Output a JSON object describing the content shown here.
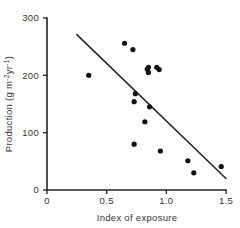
{
  "chart_data": {
    "type": "scatter",
    "title": "",
    "xlabel": "Index of  exposure",
    "ylabel": "Production (g m⁻²yr⁻¹)",
    "ylabel_parts": {
      "main": "Production (g m",
      "sup1": "-2",
      "mid": "yr",
      "sup2": "-1",
      "tail": ")"
    },
    "xlim": [
      0,
      1.5
    ],
    "ylim": [
      0,
      300
    ],
    "xticks": [
      0,
      0.5,
      1.0,
      1.5
    ],
    "xtick_labels": [
      "0",
      "0.5",
      "1.0",
      "1.5"
    ],
    "yticks": [
      0,
      100,
      200,
      300
    ],
    "ytick_labels": [
      "0",
      "100",
      "200",
      "300"
    ],
    "grid": false,
    "legend": false,
    "legend_position": "none",
    "marker": "filled-circle",
    "marker_color": "#111111",
    "axis_color": "#222222",
    "background_color": "#ffffff",
    "points": [
      {
        "x": 0.35,
        "y": 200
      },
      {
        "x": 0.65,
        "y": 256
      },
      {
        "x": 0.72,
        "y": 245
      },
      {
        "x": 0.74,
        "y": 168
      },
      {
        "x": 0.73,
        "y": 154
      },
      {
        "x": 0.73,
        "y": 80
      },
      {
        "x": 0.82,
        "y": 119
      },
      {
        "x": 0.84,
        "y": 211
      },
      {
        "x": 0.85,
        "y": 205
      },
      {
        "x": 0.85,
        "y": 214
      },
      {
        "x": 0.86,
        "y": 145
      },
      {
        "x": 0.92,
        "y": 214
      },
      {
        "x": 0.94,
        "y": 210
      },
      {
        "x": 0.95,
        "y": 68
      },
      {
        "x": 1.18,
        "y": 51
      },
      {
        "x": 1.23,
        "y": 30
      },
      {
        "x": 1.46,
        "y": 41
      }
    ],
    "trend_line": {
      "type": "straight-fit-line",
      "x_start": 0.25,
      "y_start": 271,
      "x_end": 1.5,
      "y_end": 20
    },
    "n_points": 17
  }
}
